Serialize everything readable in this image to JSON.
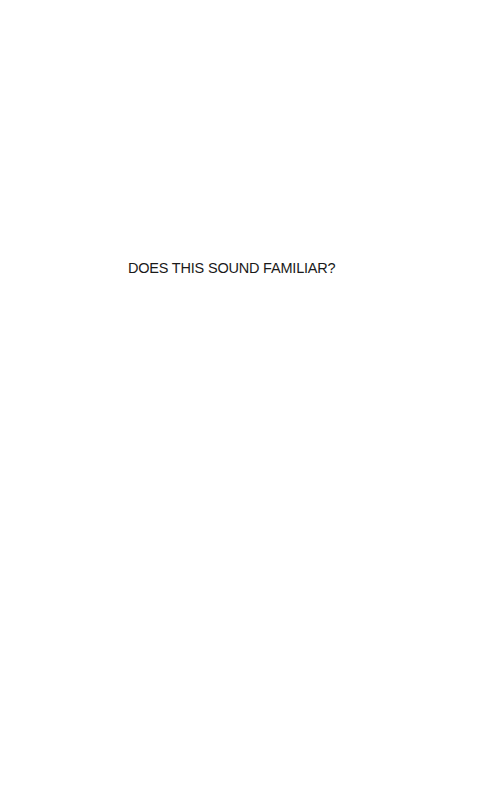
{
  "page": {
    "heading": "DOES THIS SOUND FAMILIAR?"
  }
}
